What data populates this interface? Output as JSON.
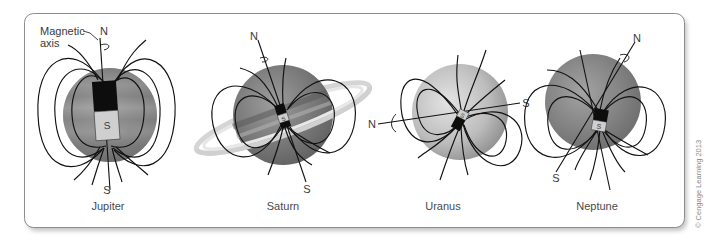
{
  "figure": {
    "annotation": {
      "line1": "Magnetic",
      "line2": "axis"
    },
    "planets": [
      {
        "name": "Jupiter",
        "north_label": "N",
        "south_label": "S",
        "magnet_label": "S"
      },
      {
        "name": "Saturn",
        "north_label": "N",
        "south_label": "S",
        "magnet_label": "S"
      },
      {
        "name": "Uranus",
        "north_label": "N",
        "south_label": "S",
        "magnet_label": "S"
      },
      {
        "name": "Neptune",
        "north_label": "N",
        "south_label": "S",
        "magnet_label": "S"
      }
    ],
    "copyright": "© Cengage Learning 2013",
    "colors": {
      "frame_border": "#8c8c8c",
      "frame_shadow": "#bdbdbd",
      "field_lines": "#111111",
      "magnet_north": "#0d0d0d",
      "magnet_south": "#cfcfcf"
    }
  }
}
